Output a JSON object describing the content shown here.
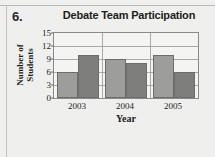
{
  "question_number": "6.",
  "chart_data": {
    "type": "bar",
    "title": "Debate Team Participation",
    "xlabel": "Year",
    "ylabel_lines": [
      "Number of",
      "Students"
    ],
    "ylabel": "Number of Students",
    "categories": [
      "2003",
      "2004",
      "2005"
    ],
    "yticks": [
      0,
      3,
      6,
      9,
      12,
      15
    ],
    "ylim": [
      0,
      15
    ],
    "grid": true,
    "legend": "none",
    "series": [
      {
        "name": "Series 1",
        "color": "#9d9d9b",
        "values": [
          6,
          9,
          10
        ]
      },
      {
        "name": "Series 2",
        "color": "#7e7e7c",
        "values": [
          10,
          8,
          6
        ]
      }
    ],
    "bars": [
      {
        "category": "2003",
        "series": "Series 1",
        "value": 6,
        "color": "#9d9d9b"
      },
      {
        "category": "2003",
        "series": "Series 2",
        "value": 10,
        "color": "#7e7e7c"
      },
      {
        "category": "2004",
        "series": "Series 1",
        "value": 9,
        "color": "#9d9d9b"
      },
      {
        "category": "2004",
        "series": "Series 2",
        "value": 8,
        "color": "#7e7e7c"
      },
      {
        "category": "2005",
        "series": "Series 1",
        "value": 10,
        "color": "#9d9d9b"
      },
      {
        "category": "2005",
        "series": "Series 2",
        "value": 6,
        "color": "#7e7e7c"
      }
    ]
  }
}
